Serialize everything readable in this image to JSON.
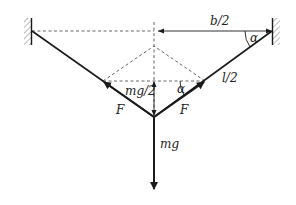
{
  "diagram": {
    "type": "physics-free-body",
    "colors": {
      "line": "#1a1a1a",
      "dashed": "#555555",
      "hatch": "#777777",
      "background": "#ffffff"
    },
    "labels": {
      "half_span": "b/2",
      "angle_top": "α",
      "half_length": "l/2",
      "half_weight": "mg/2",
      "angle_mid": "α",
      "force_left": "F",
      "force_right": "F",
      "weight": "mg"
    }
  }
}
